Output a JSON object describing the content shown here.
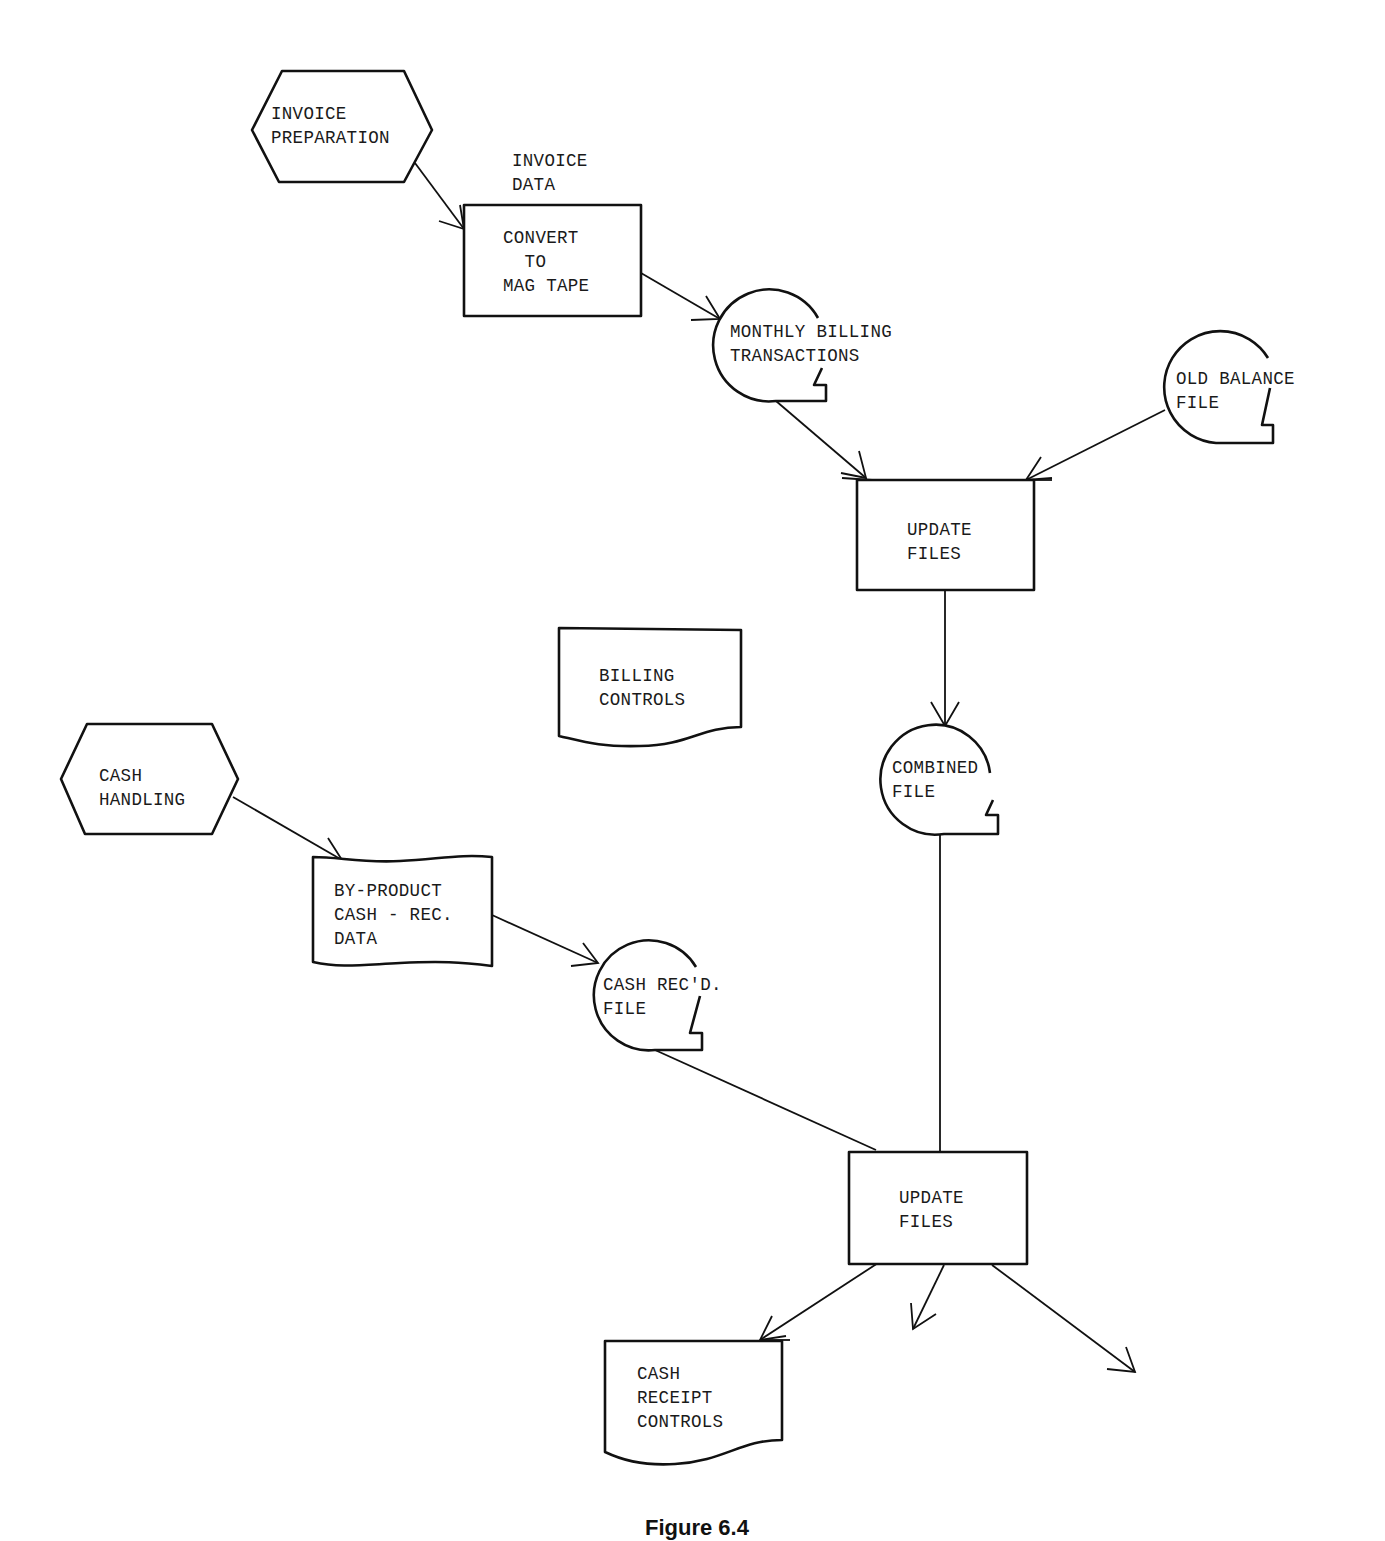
{
  "diagram": {
    "type": "system-flowchart",
    "nodes": {
      "invoice_preparation": {
        "shape": "hexagon",
        "lines": [
          "INVOICE",
          "PREPARATION"
        ]
      },
      "invoice_data_note": {
        "shape": "annotation",
        "lines": [
          "INVOICE",
          "DATA"
        ]
      },
      "convert_to_mag_tape": {
        "shape": "process",
        "lines": [
          "CONVERT",
          "TO",
          "MAG TAPE"
        ]
      },
      "monthly_billing_transactions": {
        "shape": "magnetic-tape",
        "lines": [
          "MONTHLY BILLING",
          "TRANSACTIONS"
        ]
      },
      "old_balance_file": {
        "shape": "magnetic-tape",
        "lines": [
          "OLD BALANCE",
          "FILE"
        ]
      },
      "update_files_1": {
        "shape": "process",
        "lines": [
          "UPDATE",
          "FILES"
        ]
      },
      "billing_controls": {
        "shape": "document",
        "lines": [
          "BILLING",
          "CONTROLS"
        ]
      },
      "combined_file": {
        "shape": "magnetic-tape",
        "lines": [
          "COMBINED",
          "FILE"
        ]
      },
      "cash_handling": {
        "shape": "hexagon",
        "lines": [
          "CASH",
          "HANDLING"
        ]
      },
      "by_product_cash_rec_data": {
        "shape": "punched-tape",
        "lines": [
          "BY-PRODUCT",
          "CASH - REC.",
          "DATA"
        ]
      },
      "cash_recd_file": {
        "shape": "magnetic-tape",
        "lines": [
          "CASH REC'D.",
          "FILE"
        ]
      },
      "update_files_2": {
        "shape": "process",
        "lines": [
          "UPDATE",
          "FILES"
        ]
      },
      "cash_receipt_controls": {
        "shape": "document",
        "lines": [
          "CASH",
          "RECEIPT",
          "CONTROLS"
        ]
      }
    },
    "edges": [
      {
        "from": "invoice_preparation",
        "to": "convert_to_mag_tape"
      },
      {
        "from": "convert_to_mag_tape",
        "to": "monthly_billing_transactions"
      },
      {
        "from": "monthly_billing_transactions",
        "to": "update_files_1"
      },
      {
        "from": "old_balance_file",
        "to": "update_files_1"
      },
      {
        "from": "update_files_1",
        "to": "combined_file"
      },
      {
        "from": "combined_file",
        "to": "update_files_2"
      },
      {
        "from": "cash_handling",
        "to": "by_product_cash_rec_data"
      },
      {
        "from": "by_product_cash_rec_data",
        "to": "cash_recd_file"
      },
      {
        "from": "cash_recd_file",
        "to": "update_files_2"
      },
      {
        "from": "update_files_2",
        "to": "cash_receipt_controls"
      },
      {
        "from": "update_files_2",
        "to": "(unlabeled output 1)"
      },
      {
        "from": "update_files_2",
        "to": "(unlabeled output 2)"
      }
    ],
    "caption": "Figure 6.4"
  },
  "labels": {
    "invoice_preparation": "INVOICE\nPREPARATION",
    "invoice_data": "INVOICE\nDATA",
    "convert": "CONVERT\n  TO\nMAG TAPE",
    "monthly_billing": "MONTHLY BILLING\nTRANSACTIONS",
    "old_balance": "OLD BALANCE\nFILE",
    "update_files_1": "UPDATE\nFILES",
    "billing_controls": "BILLING\nCONTROLS",
    "combined_file": "COMBINED\nFILE",
    "cash_handling": "CASH\nHANDLING",
    "by_product": "BY-PRODUCT\nCASH - REC.\nDATA",
    "cash_recd": "CASH REC'D.\nFILE",
    "update_files_2": "UPDATE\nFILES",
    "cash_receipt_controls": "CASH\nRECEIPT\nCONTROLS",
    "caption": "Figure 6.4"
  }
}
